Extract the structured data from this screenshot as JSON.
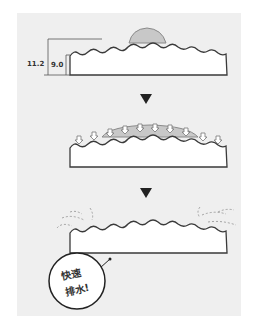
{
  "diagram": {
    "step1": {
      "dim_outer": "11.2",
      "dim_inner": "9.0",
      "droplet": "water-droplet"
    },
    "step2": {
      "description": "water absorbed into grooves",
      "arrows": 10
    },
    "step3": {
      "description": "water drained away",
      "callout": {
        "line1": "快速",
        "line2": "排水!"
      }
    },
    "colors": {
      "background": "#efefef",
      "board_fill": "#ffffff",
      "board_stroke": "#3a3a3a",
      "water": "#c8c8c8",
      "water_stroke": "#8a8a8a",
      "arrow": "#222222",
      "dashes": "#9a9a9a"
    }
  }
}
